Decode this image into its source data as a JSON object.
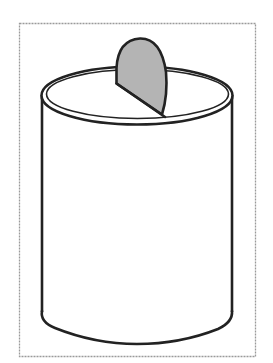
{
  "figure": {
    "alt_text": "Coin being dropped into a can",
    "colors": {
      "background": "#ffffff",
      "frame": "#9a9a9a",
      "outline": "#222222",
      "coin_fill": "#b4b4b4"
    },
    "parts": [
      {
        "name": "frame",
        "style": "dashed"
      },
      {
        "name": "can-body",
        "shape": "cylinder"
      },
      {
        "name": "can-rim",
        "shape": "double ellipse"
      },
      {
        "name": "coin",
        "shape": "half-ellipse",
        "fill": "grey"
      }
    ]
  }
}
